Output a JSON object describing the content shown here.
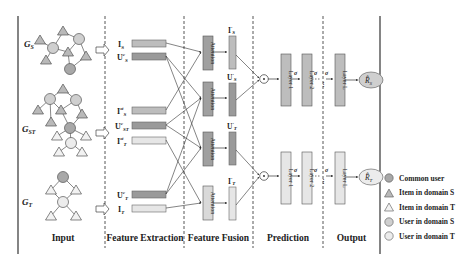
{
  "sections": [
    {
      "id": "input",
      "label": "Input",
      "center_x": 62
    },
    {
      "id": "feature_extraction",
      "label": "Feature Extraction",
      "center_x": 145
    },
    {
      "id": "feature_fusion",
      "label": "Feature Fusion",
      "center_x": 219
    },
    {
      "id": "prediction",
      "label": "Prediction",
      "center_x": 288
    },
    {
      "id": "output",
      "label": "Output",
      "center_x": 351
    }
  ],
  "graphs": [
    {
      "id": "gs",
      "label": "G",
      "sub": "S"
    },
    {
      "id": "gst",
      "label": "G",
      "sub": "ST"
    },
    {
      "id": "gt",
      "label": "G",
      "sub": "T"
    }
  ],
  "feature_extraction": {
    "vectors": [
      {
        "id": "I_S",
        "base": "I",
        "sup": "",
        "sub": "S"
      },
      {
        "id": "Uc_S",
        "base": "U",
        "sup": "c",
        "sub": "S"
      },
      {
        "id": "Ist_S",
        "base": "I",
        "sup": "st",
        "sub": "S"
      },
      {
        "id": "Uc_ST",
        "base": "U",
        "sup": "c",
        "sub": "ST"
      },
      {
        "id": "Ist_T",
        "base": "I",
        "sup": "st",
        "sub": "T"
      },
      {
        "id": "Uc_T",
        "base": "U",
        "sup": "c",
        "sub": "T"
      },
      {
        "id": "I_T",
        "base": "I",
        "sup": "",
        "sub": "T"
      }
    ]
  },
  "feature_fusion": {
    "attention_label": "Attention",
    "outputs": [
      {
        "id": "I'_S",
        "base": "I",
        "sub": "S"
      },
      {
        "id": "U'_S",
        "base": "U",
        "sub": "S"
      },
      {
        "id": "U'_T",
        "base": "U",
        "sub": "T"
      },
      {
        "id": "I'_T",
        "base": "I",
        "sub": "T"
      }
    ]
  },
  "prediction": {
    "combine_symbol": "⊙",
    "layers": [
      "Layer 1",
      "Layer 2",
      "Layer L"
    ],
    "activation": "σ",
    "ellipsis": "⋮"
  },
  "output": {
    "items": [
      {
        "id": "R_S",
        "base": "R̂",
        "sub": "S"
      },
      {
        "id": "R_T",
        "base": "R̂",
        "sub": "T"
      }
    ]
  },
  "legend": {
    "items": [
      {
        "shape": "circle",
        "label": "Common user",
        "fill": "#a8a8a8"
      },
      {
        "shape": "triangle",
        "label": "Item in domain S",
        "fill": "#b9b9b9"
      },
      {
        "shape": "triangle",
        "label": "Item in domain T",
        "fill": "#f2f2f2"
      },
      {
        "shape": "circle",
        "label": "User in domain S",
        "fill": "#cfcfcf"
      },
      {
        "shape": "circle",
        "label": "User in domain T",
        "fill": "#ececec"
      }
    ]
  },
  "colors": {
    "dark_gray": "#8f8f8f",
    "mid_gray": "#bdbdbd",
    "light_gray": "#e6e6e6",
    "stroke": "#555555",
    "line": "#333333"
  }
}
